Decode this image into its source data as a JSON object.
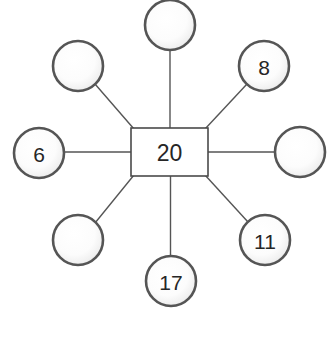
{
  "diagram": {
    "type": "star-graph",
    "title": "",
    "canvas": {
      "width": 330,
      "height": 357,
      "background": "#ffffff"
    },
    "colors": {
      "node_stroke": "#555555",
      "box_stroke": "#4a4a4a",
      "edge_stroke": "#555555",
      "text": "#262626",
      "fill_light": "#ffffff",
      "fill_shade": "#d9d9d9"
    },
    "center": {
      "name": "center-node",
      "shape": "rectangle",
      "label": "20",
      "x": 169.5,
      "y": 152,
      "width": 77,
      "height": 48
    },
    "leaves": [
      {
        "name": "node-top",
        "label": "",
        "shape": "circle",
        "x": 170,
        "y": 25,
        "r": 25,
        "angle": 90
      },
      {
        "name": "node-top-right",
        "label": "8",
        "shape": "circle",
        "x": 264,
        "y": 66,
        "r": 25,
        "angle": 45
      },
      {
        "name": "node-right",
        "label": "",
        "shape": "circle",
        "x": 300,
        "y": 152,
        "r": 25,
        "angle": 0
      },
      {
        "name": "node-bottom-right",
        "label": "11",
        "shape": "circle",
        "x": 265,
        "y": 240,
        "r": 25,
        "angle": -45
      },
      {
        "name": "node-bottom",
        "label": "17",
        "shape": "circle",
        "x": 171,
        "y": 281,
        "r": 25,
        "angle": -90
      },
      {
        "name": "node-bottom-left",
        "label": "",
        "shape": "circle",
        "x": 78,
        "y": 240,
        "r": 25,
        "angle": -135
      },
      {
        "name": "node-left",
        "label": "6",
        "shape": "circle",
        "x": 39,
        "y": 153,
        "r": 25,
        "angle": 180
      },
      {
        "name": "node-top-left",
        "label": "",
        "shape": "circle",
        "x": 78,
        "y": 66,
        "r": 25,
        "angle": 135
      }
    ],
    "edges": [
      {
        "name": "edge-center-top",
        "x1": 170,
        "y1": 128,
        "x2": 170,
        "y2": 50
      },
      {
        "name": "edge-center-top-right",
        "x1": 205,
        "y1": 129,
        "x2": 247,
        "y2": 84
      },
      {
        "name": "edge-center-right",
        "x1": 208,
        "y1": 152,
        "x2": 275,
        "y2": 152
      },
      {
        "name": "edge-center-bottom-right",
        "x1": 205,
        "y1": 175,
        "x2": 248,
        "y2": 222
      },
      {
        "name": "edge-center-bottom",
        "x1": 170.5,
        "y1": 176,
        "x2": 170.5,
        "y2": 256
      },
      {
        "name": "edge-center-bottom-left",
        "x1": 134,
        "y1": 175,
        "x2": 95,
        "y2": 223
      },
      {
        "name": "edge-center-left",
        "x1": 131,
        "y1": 152,
        "x2": 64,
        "y2": 152
      },
      {
        "name": "edge-center-top-left",
        "x1": 134,
        "y1": 129,
        "x2": 95,
        "y2": 84
      }
    ]
  }
}
